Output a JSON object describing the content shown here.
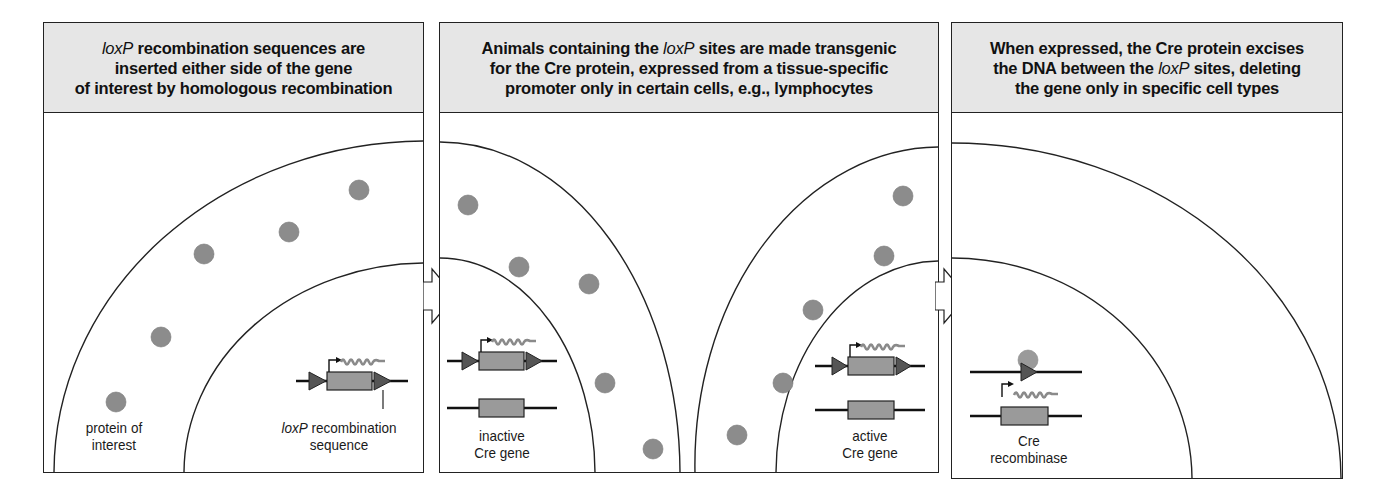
{
  "panels": [
    {
      "id": "step-1",
      "header": {
        "italic_term": "loxP",
        "line1_rest": " recombination sequences are",
        "line2": "inserted either side of the gene",
        "line3": "of interest by homologous recombination"
      },
      "labels": {
        "protein_line1": "protein of",
        "protein_line2": "interest",
        "loxp_italic": "loxP",
        "loxp_line1_rest": " recombination",
        "loxp_line2": "sequence"
      }
    },
    {
      "id": "step-2",
      "header": {
        "line1_pre": "Animals containing the ",
        "italic_term": "loxP",
        "line1_post": " sites are made transgenic",
        "line2": "for the Cre protein, expressed from a tissue-specific",
        "line3": "promoter only in certain cells, e.g., lymphocytes"
      },
      "labels": {
        "inactive_line1": "inactive",
        "inactive_line2": "Cre gene",
        "active_line1": "active",
        "active_line2": "Cre gene"
      }
    },
    {
      "id": "step-3",
      "header": {
        "line1": "When expressed, the Cre protein excises",
        "line2_pre": "the DNA between the ",
        "italic_term": "loxP",
        "line2_post": " sites, deleting",
        "line3": "the gene only in specific cell types"
      },
      "labels": {
        "cre_line1": "Cre",
        "cre_line2": "recombinase"
      }
    }
  ],
  "icons": {
    "step_arrow": "right-block-arrow",
    "protein": "grey-circle",
    "loxp_site": "dark-triangle",
    "gene": "grey-rectangle",
    "promoter": "bent-arrow",
    "mrna": "squiggle"
  },
  "colors": {
    "header_bg": "#e6e6e6",
    "outline": "#222222",
    "protein_fill": "#8c8c8c",
    "gene_fill": "#9a9a9a",
    "loxp_fill": "#555555",
    "mrna_stroke": "#8a8a8a"
  }
}
